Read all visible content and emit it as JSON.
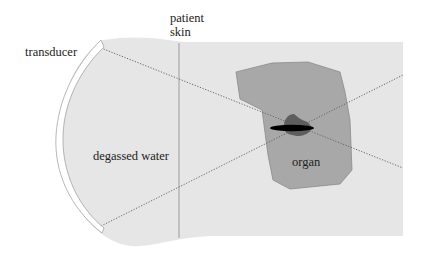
{
  "diagram": {
    "type": "schematic",
    "labels": {
      "transducer": "transducer",
      "patient_skin_line1": "patient",
      "patient_skin_line2": "skin",
      "water": "degassed water",
      "organ": "organ"
    },
    "colors": {
      "background": "#ffffff",
      "body_fill": "#e6e6e6",
      "organ_fill": "#a8a8a8",
      "organ_stroke": "#8a8a8a",
      "lesion_fill": "#5e5e5e",
      "focus_fill": "#000000",
      "beam_line": "#666666",
      "skin_line": "#888888",
      "transducer_fill": "#ffffff",
      "transducer_stroke": "#9a9a9a"
    },
    "elements": [
      {
        "name": "transducer",
        "shape": "curved arc"
      },
      {
        "name": "degassed-water",
        "shape": "region"
      },
      {
        "name": "patient-skin",
        "shape": "vertical line"
      },
      {
        "name": "beam-edges",
        "shape": "two dotted lines crossing at focus"
      },
      {
        "name": "organ",
        "shape": "polygon"
      },
      {
        "name": "focal-lesion",
        "shape": "dark blob with black ellipse"
      }
    ]
  }
}
